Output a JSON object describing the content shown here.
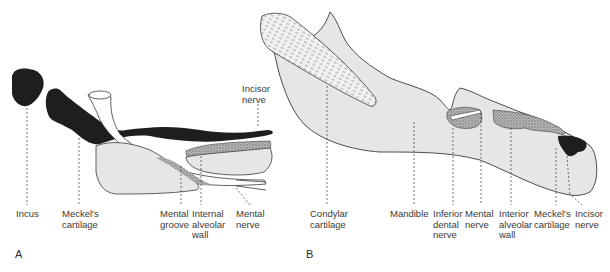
{
  "figure_a": {
    "panel_label": "A",
    "labels": {
      "incus": "Incus",
      "meckels_cartilage": "Meckel's\ncartilage",
      "mental_groove": "Mental\ngroove",
      "internal_alveolar_wall": "Internal\nalveolar\nwall",
      "mental_nerve": "Mental\nnerve",
      "incisor_nerve": "Incisor\nnerve"
    }
  },
  "figure_b": {
    "panel_label": "B",
    "labels": {
      "condylar_cartilage": "Condylar\ncartilage",
      "mandible": "Mandible",
      "inferior_dental_nerve": "Inferior\ndental\nnerve",
      "mental_nerve": "Mental\nnerve",
      "interior_alveolar_wall": "Interior\nalveolar\nwall",
      "meckels_cartilage": "Meckel's\ncartilage",
      "incisor_nerve": "Incisor\nnerve"
    }
  },
  "colors": {
    "bone_fill": "#e6e6e6",
    "cartilage_dark": "#1e1e1e",
    "outline": "#3a3a3a",
    "stipple": "#8a8a8a"
  }
}
